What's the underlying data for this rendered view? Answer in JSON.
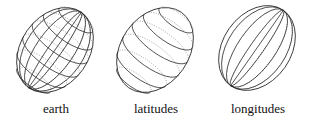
{
  "figures": [
    {
      "id": "earth",
      "label": "earth",
      "cx": 55,
      "cy": 50,
      "rx": 34,
      "ry": 46,
      "rotate": 35,
      "lat": true,
      "lon": true
    },
    {
      "id": "latitudes",
      "label": "latitudes",
      "cx": 155,
      "cy": 50,
      "rx": 34,
      "ry": 46,
      "rotate": 35,
      "lat": true,
      "lon": false
    },
    {
      "id": "longitudes",
      "label": "longitudes",
      "cx": 257,
      "cy": 48,
      "rx": 34,
      "ry": 46,
      "rotate": 35,
      "lat": false,
      "lon": true
    }
  ],
  "colors": {
    "stroke": "#222222",
    "back_stroke": "#777777"
  }
}
